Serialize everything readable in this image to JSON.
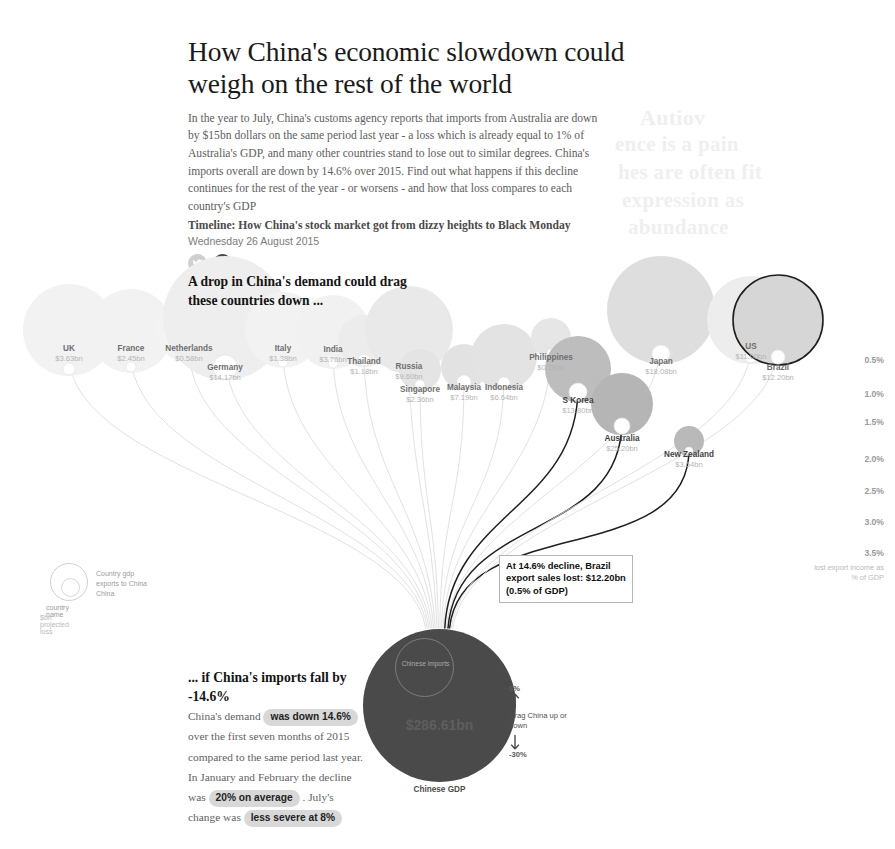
{
  "header": {
    "headline": "How China's economic slowdown could weigh on the rest of the world",
    "standfirst": "In the year to July, China's customs agency reports that imports from Australia are down by $15bn dollars on the same period last year - a loss which is already equal to 1% of Australia's GDP, and many other countries stand to lose out to similar degrees. China's imports overall are down by 14.6% over 2015. Find out what happens if this decline continues for the rest of the year - or worsens - and how that loss compares to each country's GDP",
    "timeline": "Timeline: How China's stock market got from dizzy heights to Black Monday",
    "pubdate": "Wednesday 26 August 2015",
    "social": [
      {
        "name": "twitter",
        "glyph": "t"
      },
      {
        "name": "facebook",
        "glyph": "f"
      }
    ]
  },
  "annotations": {
    "top_title": "A drop in China's demand could drag these countries down ...",
    "bottom_title": "... if China's imports fall by -14.6%",
    "body_1": "China's demand",
    "hl_1": "was down 14.6%",
    "body_2": "over the first seven months of 2015 compared to the same period last year. In January and February the decline was",
    "hl_2": "20% on average",
    "body_3": ". July's change was",
    "hl_3": "less severe at 8%"
  },
  "tooltip": {
    "line1": "At 14.6% decline, Brazil",
    "line2": "export sales lost: $12.20bn",
    "line3": "(0.5% of GDP)"
  },
  "axis": {
    "caption": "lost export income as % of GDP",
    "ticks": [
      {
        "label": "0.5%",
        "y": 360
      },
      {
        "label": "1.0%",
        "y": 394
      },
      {
        "label": "1.5%",
        "y": 422
      },
      {
        "label": "2.0%",
        "y": 459
      },
      {
        "label": "2.5%",
        "y": 491
      },
      {
        "label": "3.0%",
        "y": 522
      },
      {
        "label": "3.5%",
        "y": 553
      }
    ]
  },
  "china": {
    "inner_label": "Chinese imports",
    "value": "$286.61bn",
    "caption": "Chinese GDP"
  },
  "drag": {
    "top": "0%",
    "bottom": "-30%",
    "text": "Drag China up or down"
  },
  "legend": {
    "gdp": "Country gdp",
    "exports": "exports to China",
    "country_name": "country name",
    "loss": "$bn projected loss"
  },
  "chart_data": {
    "type": "scatter",
    "title": "How China's economic slowdown could weigh on the rest of the world",
    "ylabel": "lost export income as % of GDP",
    "ytick_labels": [
      "0.5%",
      "1.0%",
      "1.5%",
      "2.0%",
      "2.5%",
      "3.0%",
      "3.5%"
    ],
    "decline_scenario": "-14.6%",
    "china_gdp_bubble": "$286.61bn",
    "countries": [
      {
        "name": "UK",
        "loss": "$3.63bn",
        "cx": 69,
        "cy": 330,
        "r_gdp": 46,
        "r_exp": 6,
        "label_y": 344,
        "shade": "#f2f2f2",
        "dark": false
      },
      {
        "name": "France",
        "loss": "$2.45bn",
        "cx": 131,
        "cy": 331,
        "r_gdp": 42,
        "r_exp": 5,
        "label_y": 344,
        "shade": "#f2f2f2",
        "dark": false
      },
      {
        "name": "Netherlands",
        "loss": "$0.58bn",
        "cx": 189,
        "cy": 331,
        "r_gdp": 32,
        "r_exp": 4,
        "label_y": 344,
        "shade": "#f3f3f3",
        "dark": false
      },
      {
        "name": "Germany",
        "loss": "$14.17bn",
        "cx": 225,
        "cy": 318,
        "r_gdp": 62,
        "r_exp": 12,
        "label_y": 363,
        "shade": "#eeeeee",
        "dark": false
      },
      {
        "name": "Italy",
        "loss": "$1.38bn",
        "cx": 283,
        "cy": 330,
        "r_gdp": 38,
        "r_exp": 5,
        "label_y": 344,
        "shade": "#f2f2f2",
        "dark": false
      },
      {
        "name": "India",
        "loss": "$3.76bn",
        "cx": 333,
        "cy": 332,
        "r_gdp": 37,
        "r_exp": 5,
        "label_y": 345,
        "shade": "#f1f1f1",
        "dark": false
      },
      {
        "name": "Thailand",
        "loss": "$1.18bn",
        "cx": 364,
        "cy": 341,
        "r_gdp": 26,
        "r_exp": 6,
        "label_y": 357,
        "shade": "#ececec",
        "dark": false
      },
      {
        "name": "Russia",
        "loss": "$9.60bn",
        "cx": 409,
        "cy": 330,
        "r_gdp": 44,
        "r_exp": 7,
        "label_y": 362,
        "shade": "#e9e9e9",
        "dark": false
      },
      {
        "name": "Singapore",
        "loss": "$2.36bn",
        "cx": 420,
        "cy": 370,
        "r_gdp": 21,
        "r_exp": 5,
        "label_y": 385,
        "shade": "#e4e4e4",
        "dark": false
      },
      {
        "name": "Malaysia",
        "loss": "$7.19bn",
        "cx": 464,
        "cy": 367,
        "r_gdp": 23,
        "r_exp": 7,
        "label_y": 383,
        "shade": "#e2e2e2",
        "dark": false
      },
      {
        "name": "Indonesia",
        "loss": "$6.64bn",
        "cx": 504,
        "cy": 357,
        "r_gdp": 33,
        "r_exp": 6,
        "label_y": 383,
        "shade": "#e3e3e3",
        "dark": false
      },
      {
        "name": "Philippines",
        "loss": "$0.78bn",
        "cx": 551,
        "cy": 338,
        "r_gdp": 20,
        "r_exp": 4,
        "label_y": 353,
        "shade": "#e6e6e6",
        "dark": false
      },
      {
        "name": "S Korea",
        "loss": "$13.80bn",
        "cx": 578,
        "cy": 369,
        "r_gdp": 33,
        "r_exp": 9,
        "label_y": 396,
        "shade": "#bdbdbd",
        "dark": true
      },
      {
        "name": "Japan",
        "loss": "$18.08bn",
        "cx": 661,
        "cy": 310,
        "r_gdp": 54,
        "r_exp": 9,
        "label_y": 357,
        "shade": "#dedede",
        "dark": false
      },
      {
        "name": "Australia",
        "loss": "$25.20bn",
        "cx": 622,
        "cy": 404,
        "r_gdp": 31,
        "r_exp": 8,
        "label_y": 434,
        "shade": "#b5b5b5",
        "dark": true
      },
      {
        "name": "New Zealand",
        "loss": "$3.54bn",
        "cx": 689,
        "cy": 441,
        "r_gdp": 15,
        "r_exp": 4,
        "label_y": 450,
        "shade": "#b9b9b9",
        "dark": true
      },
      {
        "name": "US",
        "loss": "$11.00bn",
        "cx": 751,
        "cy": 320,
        "r_gdp": 44,
        "r_exp": 7,
        "label_y": 342,
        "shade": "#ededed",
        "dark": false
      },
      {
        "name": "Brazil",
        "loss": "$12.20bn",
        "cx": 778,
        "cy": 320,
        "r_gdp": 45,
        "r_exp": 7,
        "label_y": 363,
        "shade": "#d6d6d6",
        "dark": false
      }
    ]
  },
  "ghost": {
    "g1": "Autiov",
    "g2": "ence is a pain",
    "g3": "hes are often fit",
    "g4": "expression as",
    "g5": "abundance"
  }
}
